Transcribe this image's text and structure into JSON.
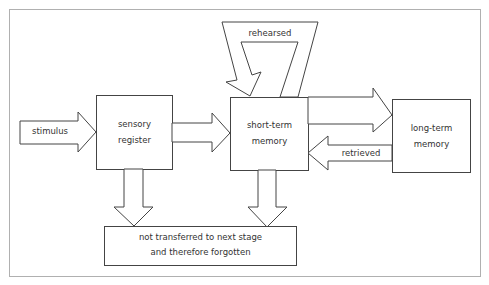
{
  "diagram": {
    "nodes": {
      "sensory_register": {
        "line1": "sensory",
        "line2": "register"
      },
      "short_term_memory": {
        "line1": "short-term",
        "line2": "memory"
      },
      "long_term_memory": {
        "line1": "long-term",
        "line2": "memory"
      },
      "forgotten": {
        "line1": "not transferred to next stage",
        "line2": "and therefore forgotten"
      }
    },
    "edges": {
      "stimulus": "stimulus",
      "rehearsed": "rehearsed",
      "retrieved": "retrieved"
    },
    "colors": {
      "stroke": "#444444",
      "frame": "#b0b0b0",
      "text": "#333333"
    }
  }
}
